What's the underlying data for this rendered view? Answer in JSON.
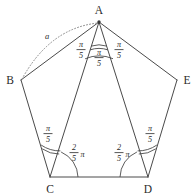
{
  "figure": {
    "background_color": "#ffffff",
    "line_color": "#4a4a4a",
    "dotted_color": "#8a8a8a",
    "text_color": "#2b2b2b"
  },
  "vertices": [
    {
      "id": "A",
      "label": "A",
      "x": 99,
      "y": 22
    },
    {
      "id": "B",
      "label": "B",
      "x": 21,
      "y": 80
    },
    {
      "id": "C",
      "label": "C",
      "x": 50,
      "y": 177
    },
    {
      "id": "D",
      "label": "D",
      "x": 148,
      "y": 177
    },
    {
      "id": "E",
      "label": "E",
      "x": 177,
      "y": 80
    }
  ],
  "vertex_labels": [
    {
      "name": "A",
      "text": "A",
      "x": 99,
      "y": 14
    },
    {
      "name": "B",
      "text": "B",
      "x": 10,
      "y": 84
    },
    {
      "name": "C",
      "text": "C",
      "x": 50,
      "y": 192
    },
    {
      "name": "D",
      "text": "D",
      "x": 148,
      "y": 192
    },
    {
      "name": "E",
      "text": "E",
      "x": 188,
      "y": 84
    }
  ],
  "edges": [
    {
      "name": "edge-ab",
      "from": "A",
      "to": "B"
    },
    {
      "name": "edge-bc",
      "from": "B",
      "to": "C"
    },
    {
      "name": "edge-cd",
      "from": "C",
      "to": "D"
    },
    {
      "name": "edge-de",
      "from": "D",
      "to": "E"
    },
    {
      "name": "edge-ea",
      "from": "E",
      "to": "A"
    }
  ],
  "diagonals": [
    {
      "name": "diagonal-ac",
      "from": "A",
      "to": "C"
    },
    {
      "name": "diagonal-ad",
      "from": "A",
      "to": "D"
    }
  ],
  "angle_labels": [
    {
      "name": "angle-bac",
      "numerator": "π",
      "denominator": "5",
      "x": 81,
      "y": 49,
      "vertex": "A",
      "value": "pi/5"
    },
    {
      "name": "angle-cad",
      "numerator": "π",
      "denominator": "5",
      "x": 99,
      "y": 56,
      "vertex": "A",
      "value": "pi/5"
    },
    {
      "name": "angle-dae",
      "numerator": "π",
      "denominator": "5",
      "x": 119,
      "y": 49,
      "vertex": "A",
      "value": "pi/5"
    },
    {
      "name": "angle-acb",
      "numerator": "π",
      "denominator": "5",
      "x": 47,
      "y": 133,
      "vertex": "C",
      "value": "pi/5"
    },
    {
      "name": "angle-adе",
      "numerator": "π",
      "denominator": "5",
      "x": 150,
      "y": 133,
      "vertex": "D",
      "value": "pi/5"
    }
  ],
  "interior_angle_labels": [
    {
      "name": "angle-acd",
      "numerator": "2",
      "denominator": "5",
      "suffix": "π",
      "x": 76,
      "y": 156,
      "vertex": "C",
      "value": "2pi/5"
    },
    {
      "name": "angle-adc",
      "numerator": "2",
      "denominator": "5",
      "suffix": "π",
      "x": 122,
      "y": 156,
      "vertex": "D",
      "value": "2pi/5"
    }
  ],
  "length_labels": [
    {
      "name": "side-length-a",
      "text": "a",
      "x": 47,
      "y": 39
    }
  ],
  "annotations": {
    "dotted_arc": {
      "name": "dotted-arc-ba",
      "from": "B",
      "to": "A",
      "label": "a",
      "style": "dotted"
    }
  }
}
